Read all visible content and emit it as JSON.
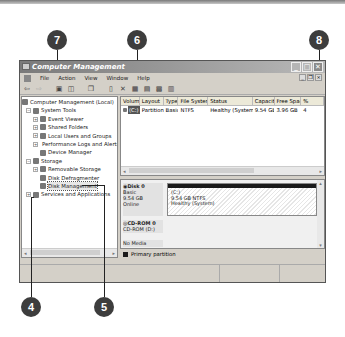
{
  "callouts": [
    {
      "label": "7",
      "target": "Action menu"
    },
    {
      "label": "6",
      "target": "Volume list"
    },
    {
      "label": "8",
      "target": "Close button"
    },
    {
      "label": "4",
      "target": "Console tree"
    },
    {
      "label": "5",
      "target": "Disk Management"
    }
  ],
  "window": {
    "title": "Computer Management",
    "buttons": {
      "minimize": "_",
      "maximize": "□",
      "close": "✕"
    }
  },
  "menubar": {
    "items": [
      "File",
      "Action",
      "View",
      "Window",
      "Help"
    ]
  },
  "mdi_buttons": {
    "minimize": "_",
    "restore": "❐",
    "close": "×"
  },
  "toolbar": {
    "icons": [
      "back-icon",
      "forward-icon",
      "up-icon",
      "show-hide-tree-icon",
      "properties-icon",
      "help-icon",
      "new-icon",
      "delete-icon",
      "disk-icon",
      "open-icon",
      "rescan-icon",
      "list-icon"
    ]
  },
  "tree": {
    "root": "Computer Management (Local)",
    "items": [
      {
        "label": "System Tools",
        "level": 1,
        "expander": "−"
      },
      {
        "label": "Event Viewer",
        "level": 2,
        "expander": "+"
      },
      {
        "label": "Shared Folders",
        "level": 2,
        "expander": "+"
      },
      {
        "label": "Local Users and Groups",
        "level": 2,
        "expander": "+"
      },
      {
        "label": "Performance Logs and Alerts",
        "level": 2,
        "expander": "+"
      },
      {
        "label": "Device Manager",
        "level": 2,
        "expander": ""
      },
      {
        "label": "Storage",
        "level": 1,
        "expander": "−"
      },
      {
        "label": "Removable Storage",
        "level": 2,
        "expander": "+"
      },
      {
        "label": "Disk Defragmenter",
        "level": 2,
        "expander": ""
      },
      {
        "label": "Disk Management",
        "level": 2,
        "expander": "",
        "selected": true
      },
      {
        "label": "Services and Applications",
        "level": 1,
        "expander": "+"
      }
    ]
  },
  "volume_list": {
    "columns": [
      "Volume",
      "Layout",
      "Type",
      "File System",
      "Status",
      "Capacity",
      "Free Space",
      "%"
    ],
    "rows": [
      {
        "volume": "(C:)",
        "layout": "Partition",
        "type": "Basic",
        "fs": "NTFS",
        "status": "Healthy (System)",
        "capacity": "9.54 GB",
        "free": "3.96 GB",
        "pct": "4"
      }
    ]
  },
  "disks": [
    {
      "name": "Disk 0",
      "type": "Basic",
      "size": "9.54 GB",
      "state": "Online",
      "partition": {
        "label": "(C:)",
        "detail": "9.54 GB NTFS",
        "status": "Healthy (System)"
      }
    },
    {
      "name": "CD-ROM 0",
      "type": "CD-ROM (D:)",
      "size": "",
      "state": "No Media"
    }
  ],
  "legend": {
    "primary": "Primary partition"
  },
  "colors": {
    "title_start": "#7a7a7a",
    "callout": "#3d3d3d",
    "partition_bar": "#1a1a1a",
    "chrome": "#d4d0c8"
  }
}
